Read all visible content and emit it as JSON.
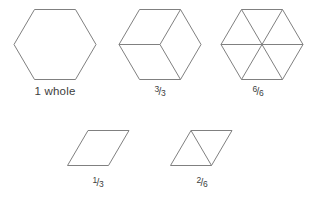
{
  "figure": {
    "stroke_color": "#808080",
    "text_color": "#3d3d3d",
    "background_color": "#ffffff"
  },
  "shapes": {
    "top_row": [
      {
        "name": "hexagon-whole",
        "caption": "1 whole",
        "parts": 1,
        "part_shape": "hexagon",
        "divider_count": 0
      },
      {
        "name": "hexagon-thirds",
        "caption_numerator": "3",
        "caption_denominator": "3",
        "caption": "3/3",
        "parts": 3,
        "part_shape": "rhombus",
        "divider_count": 3
      },
      {
        "name": "hexagon-sixths",
        "caption_numerator": "6",
        "caption_denominator": "6",
        "caption": "6/6",
        "parts": 6,
        "part_shape": "triangle",
        "divider_count": 3
      }
    ],
    "bottom_row": [
      {
        "name": "rhombus-one-third",
        "caption_numerator": "1",
        "caption_denominator": "3",
        "caption": "1/3",
        "parts": 1,
        "part_shape": "rhombus",
        "divider_count": 0
      },
      {
        "name": "rhombus-two-sixths",
        "caption_numerator": "2",
        "caption_denominator": "6",
        "caption": "2/6",
        "parts": 2,
        "part_shape": "triangle",
        "divider_count": 1
      }
    ]
  },
  "fraction_bar": "/"
}
